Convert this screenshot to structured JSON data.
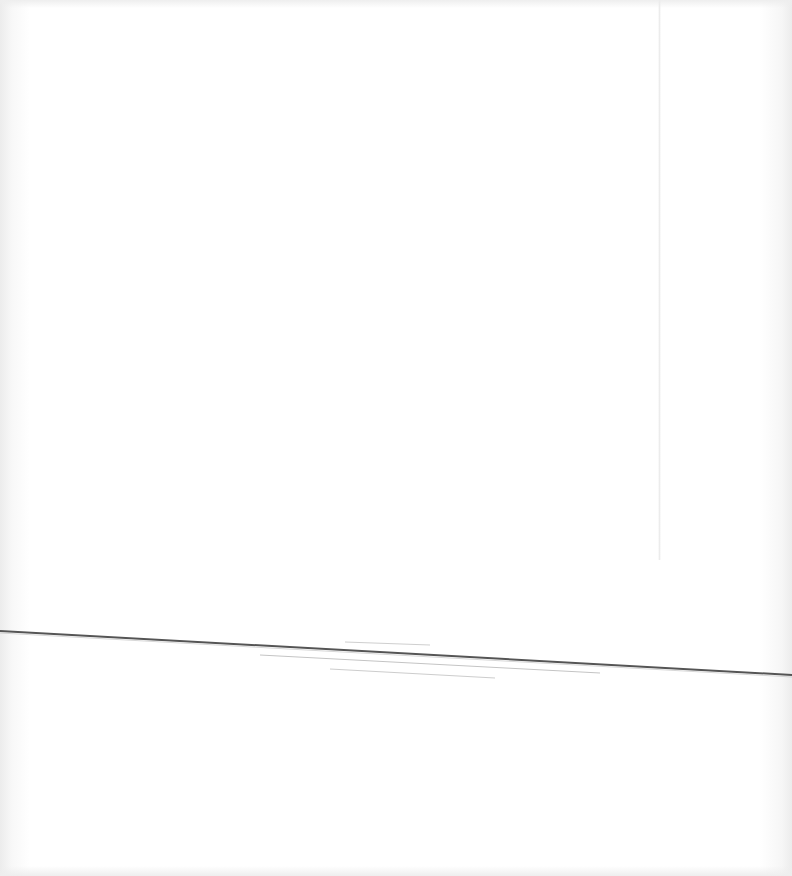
{
  "scene": {
    "description": "Blank white sheet with a thin dark diagonal line",
    "background_color": "#ffffff",
    "main_line": {
      "x1": 0,
      "y1": 631,
      "x2": 792,
      "y2": 675,
      "color": "#555555",
      "width": 2
    },
    "faint_lines": [
      {
        "x1": 345,
        "y1": 642,
        "x2": 430,
        "y2": 645,
        "color": "#cfcfcf"
      },
      {
        "x1": 260,
        "y1": 655,
        "x2": 600,
        "y2": 673,
        "color": "#c4c4c4"
      },
      {
        "x1": 330,
        "y1": 669,
        "x2": 495,
        "y2": 678,
        "color": "#cdcdcd"
      }
    ]
  }
}
